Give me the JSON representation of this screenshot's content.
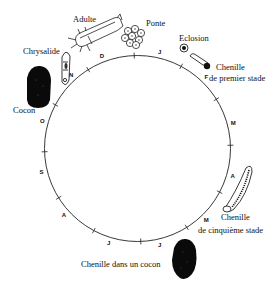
{
  "diagram": {
    "type": "life-cycle-circle",
    "circle": {
      "cx": 137.5,
      "cy": 148.5,
      "r": 93
    },
    "months": [
      {
        "label": "J",
        "angle": 13
      },
      {
        "label": "F",
        "angle": 44
      },
      {
        "label": "M",
        "angle": 75
      },
      {
        "label": "A",
        "angle": 106
      },
      {
        "label": "M",
        "angle": 136
      },
      {
        "label": "J",
        "angle": 167
      },
      {
        "label": "J",
        "angle": 197
      },
      {
        "label": "A",
        "angle": 228
      },
      {
        "label": "S",
        "angle": 256
      },
      {
        "label": "O",
        "angle": 286
      },
      {
        "label": "N",
        "angle": 318
      },
      {
        "label": "D",
        "angle": 339
      }
    ],
    "stages": {
      "adulte": "Adulte",
      "ponte": "Ponte",
      "eclosion": "Eclosion",
      "chenille1_line1": "Chenille",
      "chenille1_line2": "de premier stade",
      "chenille5_line1": "Chenille",
      "chenille5_line2": "de cinquième stade",
      "chenille_cocon": "Chenille dans un cocon",
      "cocon": "Cocon",
      "chrysalide": "Chrysalide"
    },
    "colors": {
      "ink": "#111111",
      "background": "#ffffff"
    }
  }
}
